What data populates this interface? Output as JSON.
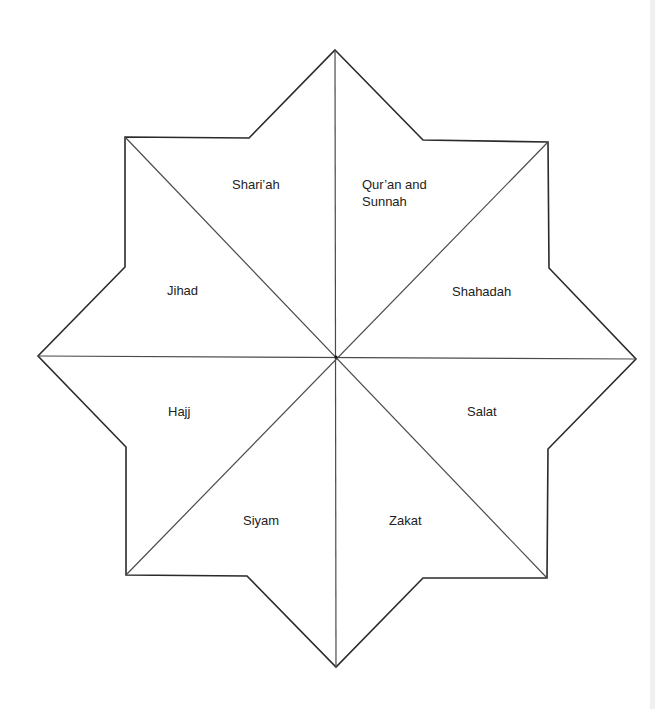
{
  "diagram": {
    "title": "",
    "shape": "eight-pointed star divided into eight segments",
    "colors": {
      "stroke": "#2a2a2a",
      "divider": "#4a4a4a",
      "text": "#222222",
      "fill": "#ffffff"
    },
    "center": [
      336,
      357
    ],
    "outline_points": [
      [
        335,
        50
      ],
      [
        423,
        140
      ],
      [
        548,
        142
      ],
      [
        549,
        268
      ],
      [
        636,
        359
      ],
      [
        548,
        449
      ],
      [
        547,
        578
      ],
      [
        423,
        578
      ],
      [
        336,
        667
      ],
      [
        247,
        576
      ],
      [
        126,
        575
      ],
      [
        126,
        447
      ],
      [
        38,
        356
      ],
      [
        125,
        267
      ],
      [
        125,
        137
      ],
      [
        249,
        138
      ]
    ],
    "dividers": [
      {
        "from": [
          335,
          50
        ],
        "to": [
          336,
          667
        ]
      },
      {
        "from": [
          38,
          356
        ],
        "to": [
          636,
          359
        ]
      },
      {
        "from": [
          125,
          137
        ],
        "to": [
          547,
          578
        ]
      },
      {
        "from": [
          548,
          142
        ],
        "to": [
          126,
          575
        ]
      }
    ],
    "segments": [
      {
        "id": "sharia",
        "label": "Shari’ah",
        "x": 232,
        "y": 176
      },
      {
        "id": "quran-sunnah",
        "label": "Qur’an and\nSunnah",
        "x": 362,
        "y": 176
      },
      {
        "id": "shahadah",
        "label": "Shahadah",
        "x": 452,
        "y": 283
      },
      {
        "id": "salat",
        "label": "Salat",
        "x": 467,
        "y": 403
      },
      {
        "id": "zakat",
        "label": "Zakat",
        "x": 389,
        "y": 512
      },
      {
        "id": "siyam",
        "label": "Siyam",
        "x": 243,
        "y": 512
      },
      {
        "id": "hajj",
        "label": "Hajj",
        "x": 168,
        "y": 403
      },
      {
        "id": "jihad",
        "label": "Jihad",
        "x": 167,
        "y": 282
      }
    ]
  }
}
